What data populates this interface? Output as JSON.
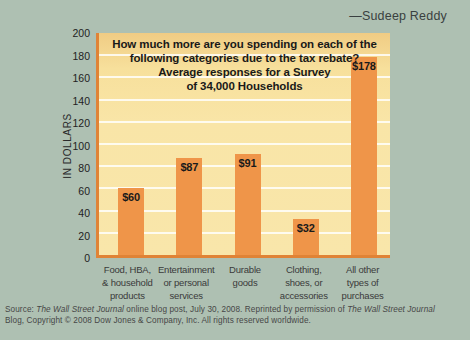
{
  "byline": "—Sudeep Reddy",
  "chart_data": {
    "type": "bar",
    "title_lines": [
      "How much more are you spending on each of the",
      "following categories due to the tax rebate?",
      "Average responses for a Survey",
      "of 34,000 Households"
    ],
    "ylabel": "IN DOLLARS",
    "xlabel": "",
    "ylim": [
      0,
      200
    ],
    "y_ticks": [
      200,
      180,
      160,
      140,
      120,
      100,
      80,
      60,
      40,
      20,
      0
    ],
    "grid": "horizontal white gridlines every 20",
    "legend": "none",
    "categories": [
      [
        "Food, HBA,",
        "& household",
        "products"
      ],
      [
        "Entertainment",
        "or personal",
        "services"
      ],
      [
        "Durable",
        "goods"
      ],
      [
        "Clothing,",
        "shoes, or",
        "accessories"
      ],
      [
        "All other",
        "types of",
        "purchases"
      ]
    ],
    "values": [
      60,
      87,
      91,
      32,
      178
    ],
    "bar_labels": [
      "$60",
      "$87",
      "$91",
      "$32",
      "$178"
    ],
    "colors": {
      "page_bg": "#aec0b2",
      "plot_bg": "#f9e5a7",
      "plot_bg_top": "#f0cc84",
      "bar": "#ef9549",
      "axis": "#e08336",
      "gridline": "#ffffff",
      "text": "#1a1a1a"
    }
  },
  "source": {
    "prefix": "Source: ",
    "italic1": "The Wall Street Journal",
    "middle": " online blog post, July 30, 2008. Reprinted by permission of ",
    "italic2": "The Wall Street Journal",
    "line2": "Blog, Copyright © 2008 Dow Jones & Company, Inc. All rights reserved worldwide."
  }
}
